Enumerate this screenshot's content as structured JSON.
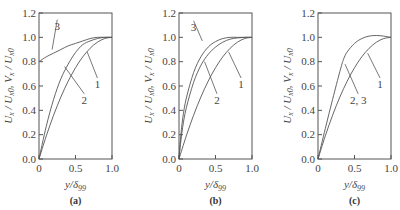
{
  "chart_data": [
    {
      "type": "line",
      "panel": "(a)",
      "xlabel": "y/δ99",
      "ylabel": "Ux/Ux0, Vx/Ux0",
      "xlim": [
        0,
        1.0
      ],
      "ylim": [
        0,
        1.2
      ],
      "xticks": [
        "0",
        "0.5",
        "1.0"
      ],
      "yticks": [
        "0.0",
        "0.2",
        "0.4",
        "0.6",
        "0.8",
        "1.0",
        "1.2"
      ],
      "grid": false,
      "series": [
        {
          "name": "1",
          "x": [
            0,
            0.1,
            0.2,
            0.3,
            0.4,
            0.5,
            0.6,
            0.7,
            0.8,
            0.9,
            1.0
          ],
          "y": [
            0,
            0.19,
            0.36,
            0.51,
            0.64,
            0.75,
            0.84,
            0.91,
            0.96,
            0.99,
            1.0
          ]
        },
        {
          "name": "2",
          "x": [
            0,
            0.1,
            0.2,
            0.3,
            0.4,
            0.5,
            0.6,
            0.7,
            0.8,
            0.9,
            1.0
          ],
          "y": [
            0,
            0.27,
            0.49,
            0.66,
            0.78,
            0.875,
            0.94,
            0.97,
            0.99,
            1.0,
            1.0
          ]
        },
        {
          "name": "3",
          "x": [
            0,
            0.1,
            0.2,
            0.3,
            0.4,
            0.5,
            0.6,
            0.7,
            0.8,
            0.9,
            1.0
          ],
          "y": [
            0.8,
            0.84,
            0.87,
            0.9,
            0.93,
            0.95,
            0.97,
            0.99,
            1.0,
            1.0,
            1.0
          ]
        }
      ],
      "annotations": [
        {
          "text": "3",
          "x": 0.25,
          "y": 1.08,
          "tx": 0.18,
          "ty": 0.9
        },
        {
          "text": "2",
          "x": 0.62,
          "y": 0.47,
          "tx": 0.35,
          "ty": 0.76
        },
        {
          "text": "1",
          "x": 0.8,
          "y": 0.6,
          "tx": 0.66,
          "ty": 0.88
        }
      ]
    },
    {
      "type": "line",
      "panel": "(b)",
      "xlabel": "y/δ99",
      "ylabel": "Ux/Ux0, Vx/Ux0",
      "xlim": [
        0,
        1.0
      ],
      "ylim": [
        0,
        1.2
      ],
      "xticks": [
        "0",
        "0.5",
        "1.0"
      ],
      "yticks": [
        "0.0",
        "0.2",
        "0.4",
        "0.6",
        "0.8",
        "1.0",
        "1.2"
      ],
      "grid": false,
      "series": [
        {
          "name": "1",
          "x": [
            0,
            0.1,
            0.2,
            0.3,
            0.4,
            0.5,
            0.6,
            0.7,
            0.8,
            0.9,
            1.0
          ],
          "y": [
            0,
            0.19,
            0.36,
            0.51,
            0.64,
            0.75,
            0.84,
            0.91,
            0.96,
            0.99,
            1.0
          ]
        },
        {
          "name": "2",
          "x": [
            0,
            0.02,
            0.05,
            0.1,
            0.2,
            0.3,
            0.4,
            0.5,
            0.6,
            0.7,
            0.8,
            0.9,
            1.0
          ],
          "y": [
            0,
            0.12,
            0.26,
            0.42,
            0.63,
            0.77,
            0.86,
            0.92,
            0.96,
            0.985,
            0.995,
            1.0,
            1.0
          ]
        },
        {
          "name": "3",
          "x": [
            0,
            0.02,
            0.05,
            0.1,
            0.2,
            0.3,
            0.4,
            0.5,
            0.6,
            0.7,
            0.8,
            0.9,
            1.0
          ],
          "y": [
            0,
            0.16,
            0.33,
            0.5,
            0.71,
            0.84,
            0.92,
            0.965,
            0.99,
            1.0,
            1.0,
            1.0,
            1.0
          ]
        }
      ],
      "annotations": [
        {
          "text": "3",
          "x": 0.2,
          "y": 1.07,
          "tx": 0.32,
          "ty": 0.97
        },
        {
          "text": "2",
          "x": 0.52,
          "y": 0.47,
          "tx": 0.35,
          "ty": 0.8
        },
        {
          "text": "1",
          "x": 0.85,
          "y": 0.6,
          "tx": 0.68,
          "ty": 0.88
        }
      ]
    },
    {
      "type": "line",
      "panel": "(c)",
      "xlabel": "y/δ99",
      "ylabel": "Ux/Ux0, Vx/Ux0",
      "xlim": [
        0,
        1.0
      ],
      "ylim": [
        0,
        1.2
      ],
      "xticks": [
        "0",
        "0.5",
        "1.0"
      ],
      "yticks": [
        "0.0",
        "0.2",
        "0.4",
        "0.6",
        "0.8",
        "1.0",
        "1.2"
      ],
      "grid": false,
      "series": [
        {
          "name": "1",
          "x": [
            0,
            0.1,
            0.2,
            0.3,
            0.4,
            0.5,
            0.6,
            0.7,
            0.8,
            0.9,
            1.0
          ],
          "y": [
            0,
            0.19,
            0.36,
            0.51,
            0.64,
            0.75,
            0.84,
            0.91,
            0.96,
            0.99,
            1.0
          ]
        },
        {
          "name": "2, 3",
          "x": [
            0,
            0.1,
            0.2,
            0.3,
            0.35,
            0.4,
            0.5,
            0.6,
            0.7,
            0.8,
            0.9,
            1.0
          ],
          "y": [
            0,
            0.25,
            0.49,
            0.72,
            0.82,
            0.88,
            0.95,
            0.99,
            1.01,
            1.015,
            1.01,
            1.0
          ]
        }
      ],
      "annotations": [
        {
          "text": "2, 3",
          "x": 0.55,
          "y": 0.47,
          "tx": 0.37,
          "ty": 0.78
        },
        {
          "text": "1",
          "x": 0.85,
          "y": 0.6,
          "tx": 0.68,
          "ty": 0.87
        }
      ]
    }
  ]
}
